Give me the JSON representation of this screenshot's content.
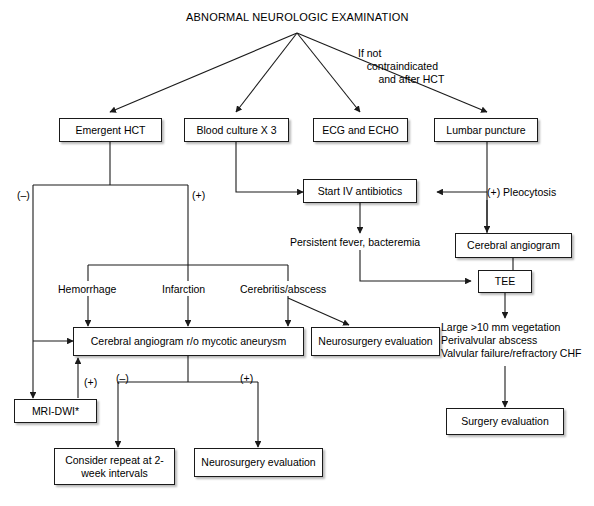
{
  "diagram": {
    "title": "ABNORMAL NEUROLOGIC EXAMINATION",
    "note_if_not": "If not\n   contraindicated\n       and after HCT",
    "nodes": {
      "emergent_hct": "Emergent HCT",
      "blood_culture": "Blood culture X 3",
      "ecg_echo": "ECG and ECHO",
      "lumbar_puncture": "Lumbar puncture",
      "start_iv_antibiotics": "Start IV antibiotics",
      "cerebral_angiogram": "Cerebral angiogram",
      "tee": "TEE",
      "angiogram_mycotic": "Cerebral angiogram r/o mycotic aneurysm",
      "neurosurgery_eval_1": "Neurosurgery evaluation",
      "mri_dwi": "MRI-DWI*",
      "consider_repeat": "Consider repeat at 2-week intervals",
      "neurosurgery_eval_2": "Neurosurgery evaluation",
      "surgery_eval": "Surgery evaluation"
    },
    "labels": {
      "hct_negative": "(–)",
      "hct_positive": "(+)",
      "pleocytosis": "(+) Pleocytosis",
      "persistent_fever": "Persistent fever, bacteremia",
      "hemorrhage": "Hemorrhage",
      "infarction": "Infarction",
      "cerebritis_abscess": "Cerebritis/abscess",
      "tee_criteria": "Large >10 mm vegetation\nPerivalvular abscess\nValvular failure/refractory CHF",
      "mri_positive": "(+)",
      "angio_negative": "(–)",
      "angio_positive": "(+)"
    },
    "colors": {
      "line": "#1a1a1a",
      "box_border": "#1a1a1a",
      "background": "#ffffff",
      "text": "#000000"
    }
  }
}
